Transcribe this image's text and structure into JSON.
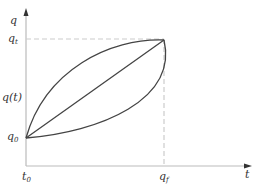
{
  "diagram": {
    "axes": {
      "y_label": "q",
      "x_label": "t"
    },
    "y_ticks": {
      "q_t": {
        "base": "q",
        "sub": "t"
      },
      "q_of_t": "q(t)",
      "q_0": {
        "base": "q",
        "sub": "0"
      }
    },
    "x_ticks": {
      "t_0": {
        "base": "t",
        "sub": "0"
      },
      "q_f": {
        "base": "q",
        "sub": "f"
      }
    },
    "curves": [
      "upper-concave-curve",
      "linear-line",
      "lower-convex-curve"
    ],
    "colors": {
      "axis": "#bbbbbb",
      "curve": "#444444",
      "dashed": "#cccccc",
      "text": "#333333"
    }
  }
}
